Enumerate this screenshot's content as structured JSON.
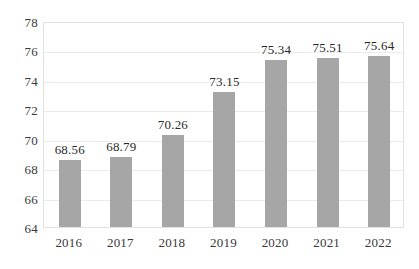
{
  "chart_data": {
    "type": "bar",
    "title": "",
    "subtitle": "",
    "xlabel": "",
    "ylabel": "",
    "categories": [
      "2016",
      "2017",
      "2018",
      "2019",
      "2020",
      "2021",
      "2022"
    ],
    "values": [
      68.56,
      68.79,
      70.26,
      73.15,
      75.34,
      75.51,
      75.64
    ],
    "data_labels": [
      "68.56",
      "68.79",
      "70.26",
      "73.15",
      "75.34",
      "75.51",
      "75.64"
    ],
    "ylim": [
      64,
      78
    ],
    "y_ticks": [
      64,
      66,
      68,
      70,
      72,
      74,
      76,
      78
    ],
    "y_tick_labels": [
      "64",
      "66",
      "68",
      "70",
      "72",
      "74",
      "76",
      "78"
    ],
    "y_tick_step": 2,
    "grid": true,
    "grid_axis": "y",
    "legend": false,
    "legend_position": "none",
    "series": [
      {
        "name": "",
        "color": "#a6a6a6",
        "values": [
          68.56,
          68.79,
          70.26,
          73.15,
          75.34,
          75.51,
          75.64
        ]
      }
    ],
    "colors": {
      "bar": "#a6a6a6",
      "gridline": "#ececec",
      "plot_border": "#e2e2e2",
      "text": "#2b2b2b",
      "background": "#ffffff"
    }
  }
}
